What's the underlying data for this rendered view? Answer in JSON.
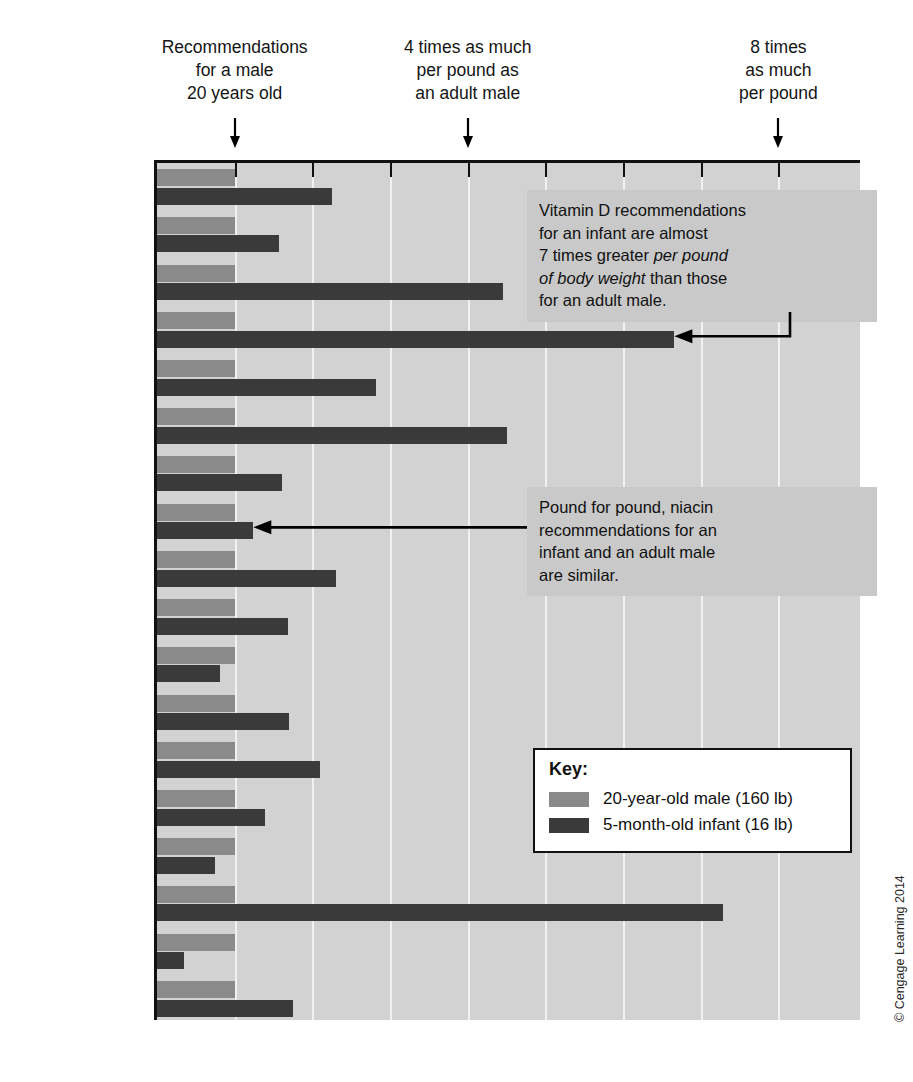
{
  "figure": {
    "credit": "© Cengage Learning 2014"
  },
  "top_notes": [
    {
      "name": "note-adult-reference",
      "lines": [
        "Recommendations",
        "for a male",
        "20 years old"
      ],
      "value": 1
    },
    {
      "name": "note-four-times",
      "lines": [
        "4 times as much",
        "per pound as",
        "an adult male"
      ],
      "value": 4
    },
    {
      "name": "note-eight-times",
      "lines": [
        "8 times",
        "as much",
        "per pound"
      ],
      "value": 8
    }
  ],
  "callouts": [
    {
      "name": "callout-vitamin-d",
      "target": "Vitamin D",
      "lines": [
        [
          {
            "t": "Vitamin D recommendations",
            "i": false
          }
        ],
        [
          {
            "t": "for an infant are almost",
            "i": false
          }
        ],
        [
          {
            "t": "7 times greater ",
            "i": false
          },
          {
            "t": "per pound",
            "i": true
          }
        ],
        [
          {
            "t": "of body weight",
            "i": true
          },
          {
            "t": " than those",
            "i": false
          }
        ],
        [
          {
            "t": "for an adult male.",
            "i": false
          }
        ]
      ]
    },
    {
      "name": "callout-niacin",
      "target": "Niacin",
      "lines": [
        [
          {
            "t": "Pound for pound, niacin",
            "i": false
          }
        ],
        [
          {
            "t": "recommendations for an",
            "i": false
          }
        ],
        [
          {
            "t": "infant and an adult male",
            "i": false
          }
        ],
        [
          {
            "t": "are similar.",
            "i": false
          }
        ]
      ]
    }
  ],
  "legend": {
    "title": "Key:",
    "entries": [
      {
        "label": "20-year-old male (160 lb)",
        "color": "#8a8a8a",
        "series": "adult"
      },
      {
        "label": "5-month-old infant (16 lb)",
        "color": "#3a3a3a",
        "series": "infant"
      }
    ]
  },
  "chart_data": {
    "type": "bar",
    "orientation": "horizontal",
    "title": "",
    "xlabel": "",
    "ylabel": "",
    "xlim": [
      0,
      9.05
    ],
    "xticks": [
      1,
      2,
      3,
      4,
      5,
      6,
      7,
      8
    ],
    "grid": true,
    "legend_position": "inside-bottom-right",
    "categories": [
      "Energy",
      "Protein",
      "Vitamin A",
      "Vitamin D",
      "Vitamin E",
      "Vitamin C",
      "Folate",
      "Niacin",
      "Riboflavin",
      "Thiamin",
      "Vitamin B6",
      "Vitamin B12",
      "Calcium",
      "Phosphorus",
      "Magnesium",
      "Iodine",
      "Iron",
      "Zinc"
    ],
    "category_labels_html": [
      "Energy",
      "Protein",
      "Vitamin A",
      "Vitamin D",
      "Vitamin E",
      "Vitamin C",
      "Folate",
      "Niacin",
      "Riboflavin",
      "Thiamin",
      "Vitamin B<sub>6</sub>",
      "Vitamin B<sub>12</sub>",
      "Calcium",
      "Phosphorus",
      "Magnesium",
      "Iodine",
      "Iron",
      "Zinc"
    ],
    "series": [
      {
        "name": "20-year-old male (160 lb)",
        "color": "#8a8a8a",
        "values": [
          1,
          1,
          1,
          1,
          1,
          1,
          1,
          1,
          1,
          1,
          1,
          1,
          1,
          1,
          1,
          1,
          1,
          1
        ]
      },
      {
        "name": "5-month-old infant (16 lb)",
        "color": "#3a3a3a",
        "values": [
          2.25,
          1.57,
          4.45,
          6.66,
          2.82,
          4.51,
          1.61,
          1.24,
          2.31,
          1.69,
          0.81,
          1.7,
          2.1,
          1.39,
          0.75,
          7.29,
          0.35,
          1.75
        ]
      }
    ]
  }
}
